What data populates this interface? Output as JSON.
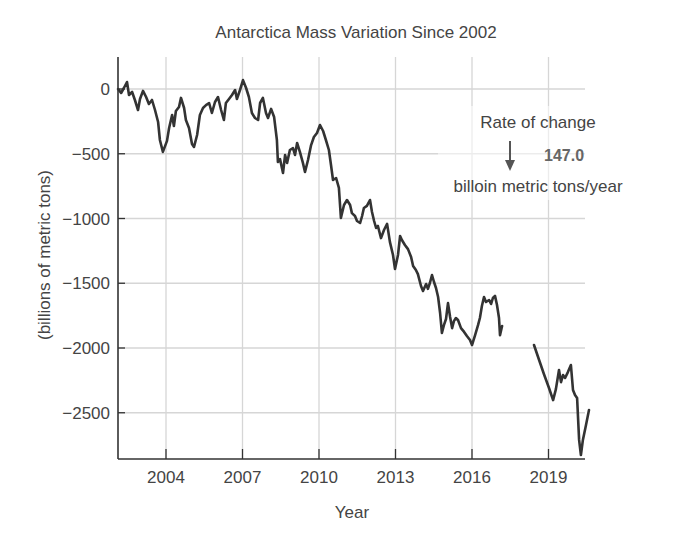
{
  "chart_data": {
    "type": "line",
    "title": "Antarctica Mass Variation Since 2002",
    "xlabel": "Year",
    "ylabel": "(billions of metric tons)",
    "x_ticks": [
      2004,
      2007,
      2010,
      2013,
      2016,
      2019
    ],
    "y_ticks": [
      0,
      -500,
      -1000,
      -1500,
      -2000,
      -2500
    ],
    "y_tick_labels": [
      "0",
      "−500",
      "−1000",
      "−1500",
      "−2000",
      "−2500"
    ],
    "xlim": [
      2002.1,
      2020.8
    ],
    "ylim": [
      -2850,
      250
    ],
    "grid": true,
    "line_color": "#333333",
    "grid_color": "#d6d6d6",
    "annotation": {
      "line1": "Rate of change",
      "value": "147.0",
      "line2": "billoin metric tons/year",
      "arrow": "down-arrow"
    },
    "series": [
      {
        "name": "Antarctica mass variation (segment 1)",
        "points": [
          [
            2002.12,
            0
          ],
          [
            2002.24,
            -31
          ],
          [
            2002.35,
            8
          ],
          [
            2002.47,
            54
          ],
          [
            2002.55,
            -46
          ],
          [
            2002.67,
            -23
          ],
          [
            2002.78,
            -85
          ],
          [
            2002.9,
            -162
          ],
          [
            2002.98,
            -77
          ],
          [
            2003.1,
            -15
          ],
          [
            2003.22,
            -62
          ],
          [
            2003.33,
            -116
          ],
          [
            2003.45,
            -85
          ],
          [
            2003.57,
            -162
          ],
          [
            2003.69,
            -255
          ],
          [
            2003.76,
            -394
          ],
          [
            2003.88,
            -486
          ],
          [
            2004.04,
            -401
          ],
          [
            2004.12,
            -301
          ],
          [
            2004.24,
            -201
          ],
          [
            2004.31,
            -286
          ],
          [
            2004.39,
            -170
          ],
          [
            2004.51,
            -139
          ],
          [
            2004.59,
            -69
          ],
          [
            2004.71,
            -147
          ],
          [
            2004.78,
            -239
          ],
          [
            2004.9,
            -301
          ],
          [
            2005.02,
            -425
          ],
          [
            2005.1,
            -448
          ],
          [
            2005.22,
            -355
          ],
          [
            2005.33,
            -201
          ],
          [
            2005.45,
            -147
          ],
          [
            2005.57,
            -124
          ],
          [
            2005.69,
            -108
          ],
          [
            2005.8,
            -185
          ],
          [
            2005.92,
            -100
          ],
          [
            2006.04,
            -62
          ],
          [
            2006.16,
            -162
          ],
          [
            2006.27,
            -239
          ],
          [
            2006.35,
            -108
          ],
          [
            2006.47,
            -77
          ],
          [
            2006.59,
            -46
          ],
          [
            2006.71,
            -8
          ],
          [
            2006.78,
            -77
          ],
          [
            2006.9,
            -8
          ],
          [
            2007.02,
            69
          ],
          [
            2007.14,
            8
          ],
          [
            2007.25,
            -62
          ],
          [
            2007.37,
            -185
          ],
          [
            2007.49,
            -224
          ],
          [
            2007.61,
            -239
          ],
          [
            2007.69,
            -108
          ],
          [
            2007.8,
            -69
          ],
          [
            2007.92,
            -185
          ],
          [
            2008.0,
            -224
          ],
          [
            2008.12,
            -154
          ],
          [
            2008.24,
            -216
          ],
          [
            2008.35,
            -394
          ],
          [
            2008.39,
            -564
          ],
          [
            2008.47,
            -541
          ],
          [
            2008.59,
            -649
          ],
          [
            2008.67,
            -510
          ],
          [
            2008.75,
            -571
          ],
          [
            2008.86,
            -471
          ],
          [
            2008.98,
            -456
          ],
          [
            2009.06,
            -510
          ],
          [
            2009.14,
            -417
          ],
          [
            2009.25,
            -486
          ],
          [
            2009.37,
            -571
          ],
          [
            2009.45,
            -641
          ],
          [
            2009.57,
            -548
          ],
          [
            2009.69,
            -433
          ],
          [
            2009.8,
            -371
          ],
          [
            2009.92,
            -340
          ],
          [
            2010.04,
            -278
          ],
          [
            2010.16,
            -324
          ],
          [
            2010.27,
            -394
          ],
          [
            2010.39,
            -471
          ],
          [
            2010.47,
            -587
          ],
          [
            2010.55,
            -703
          ],
          [
            2010.67,
            -687
          ],
          [
            2010.78,
            -764
          ],
          [
            2010.86,
            -996
          ],
          [
            2010.98,
            -896
          ],
          [
            2011.1,
            -857
          ],
          [
            2011.22,
            -896
          ],
          [
            2011.29,
            -958
          ],
          [
            2011.41,
            -981
          ],
          [
            2011.49,
            -1019
          ],
          [
            2011.61,
            -1035
          ],
          [
            2011.69,
            -981
          ],
          [
            2011.76,
            -919
          ],
          [
            2011.88,
            -903
          ],
          [
            2012.0,
            -857
          ],
          [
            2012.08,
            -950
          ],
          [
            2012.16,
            -1019
          ],
          [
            2012.24,
            -1073
          ],
          [
            2012.31,
            -1058
          ],
          [
            2012.43,
            -1151
          ],
          [
            2012.55,
            -1089
          ],
          [
            2012.67,
            -1042
          ],
          [
            2012.78,
            -1181
          ],
          [
            2012.9,
            -1282
          ],
          [
            2012.98,
            -1390
          ],
          [
            2013.1,
            -1282
          ],
          [
            2013.18,
            -1135
          ],
          [
            2013.25,
            -1166
          ],
          [
            2013.37,
            -1205
          ],
          [
            2013.49,
            -1236
          ],
          [
            2013.61,
            -1297
          ],
          [
            2013.69,
            -1367
          ],
          [
            2013.8,
            -1398
          ],
          [
            2013.88,
            -1429
          ],
          [
            2014.0,
            -1521
          ],
          [
            2014.08,
            -1560
          ],
          [
            2014.2,
            -1506
          ],
          [
            2014.27,
            -1544
          ],
          [
            2014.35,
            -1498
          ],
          [
            2014.43,
            -1436
          ],
          [
            2014.51,
            -1490
          ],
          [
            2014.59,
            -1537
          ],
          [
            2014.67,
            -1606
          ],
          [
            2014.75,
            -1730
          ],
          [
            2014.82,
            -1884
          ],
          [
            2014.9,
            -1822
          ],
          [
            2014.98,
            -1776
          ],
          [
            2015.06,
            -1653
          ],
          [
            2015.14,
            -1761
          ],
          [
            2015.22,
            -1846
          ],
          [
            2015.29,
            -1792
          ],
          [
            2015.37,
            -1768
          ],
          [
            2015.45,
            -1784
          ],
          [
            2015.57,
            -1846
          ],
          [
            2015.69,
            -1876
          ],
          [
            2015.8,
            -1907
          ],
          [
            2015.92,
            -1938
          ],
          [
            2016.0,
            -1977
          ],
          [
            2016.12,
            -1900
          ],
          [
            2016.24,
            -1822
          ],
          [
            2016.31,
            -1768
          ],
          [
            2016.39,
            -1676
          ],
          [
            2016.47,
            -1606
          ],
          [
            2016.55,
            -1645
          ],
          [
            2016.67,
            -1629
          ],
          [
            2016.75,
            -1660
          ],
          [
            2016.82,
            -1614
          ],
          [
            2016.9,
            -1598
          ],
          [
            2016.98,
            -1668
          ],
          [
            2017.06,
            -1768
          ],
          [
            2017.1,
            -1900
          ],
          [
            2017.18,
            -1830
          ]
        ]
      },
      {
        "name": "Antarctica mass variation (segment 2)",
        "points": [
          [
            2018.43,
            -1977
          ],
          [
            2018.63,
            -2093
          ],
          [
            2018.82,
            -2201
          ],
          [
            2019.02,
            -2309
          ],
          [
            2019.18,
            -2402
          ],
          [
            2019.29,
            -2317
          ],
          [
            2019.41,
            -2170
          ],
          [
            2019.49,
            -2263
          ],
          [
            2019.57,
            -2209
          ],
          [
            2019.65,
            -2232
          ],
          [
            2019.76,
            -2186
          ],
          [
            2019.88,
            -2131
          ],
          [
            2019.96,
            -2324
          ],
          [
            2020.04,
            -2363
          ],
          [
            2020.12,
            -2386
          ],
          [
            2020.2,
            -2710
          ],
          [
            2020.27,
            -2826
          ],
          [
            2020.35,
            -2710
          ],
          [
            2020.47,
            -2595
          ],
          [
            2020.59,
            -2479
          ]
        ]
      }
    ]
  }
}
